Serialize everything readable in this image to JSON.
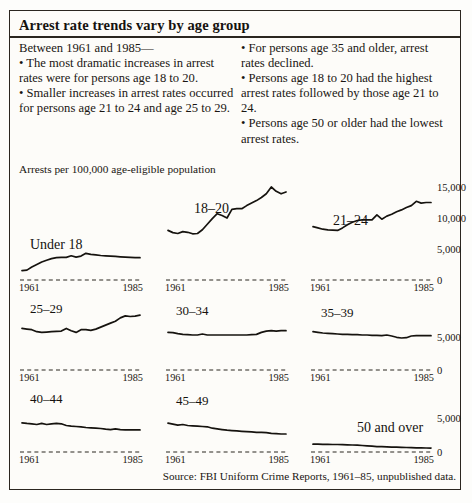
{
  "figure": {
    "title": "Arrest rate trends vary by age group",
    "left_column": [
      "Between 1961 and 1985—",
      "• The most dramatic increases in arrest rates were for persons age 18 to 20.",
      "• Smaller increases in arrest rates occurred for persons age 21 to 24 and age 25 to 29."
    ],
    "right_column": [
      "• For persons age 35 and older, arrest rates declined.",
      "• Persons age 18 to 20 had the highest arrest rates followed by those age 21 to 24.",
      "• Persons age 50 or older had the lowest arrest rates."
    ],
    "axis_caption": "Arrests per 100,000 age-eligible population",
    "source": "Source: FBI Uniform Crime Reports, 1961–85, unpublished data."
  },
  "chart_data": {
    "type": "line",
    "title": "Arrest rate trends vary by age group",
    "ylabel": "Arrests per 100,000 age-eligible population",
    "xlabel": "",
    "x": [
      1961,
      1962,
      1963,
      1964,
      1965,
      1966,
      1967,
      1968,
      1969,
      1970,
      1971,
      1972,
      1973,
      1974,
      1975,
      1976,
      1977,
      1978,
      1979,
      1980,
      1981,
      1982,
      1983,
      1984,
      1985
    ],
    "x_tick_labels": [
      "1961",
      "1985"
    ],
    "grid": false,
    "legend": "panel-labels",
    "rows": [
      {
        "ylim": [
          0,
          15000
        ],
        "y_ticks": [
          0,
          5000,
          10000,
          15000
        ],
        "y_tick_labels": [
          "0",
          "5,000",
          "10,000",
          "15,000"
        ],
        "panels": [
          {
            "name": "Under 18",
            "values": [
              1500,
              1600,
              2100,
              2500,
              2900,
              3200,
              3450,
              3600,
              3650,
              3650,
              3900,
              3700,
              3850,
              4300,
              4150,
              4050,
              3950,
              3900,
              3850,
              3800,
              3750,
              3700,
              3650,
              3600,
              3600
            ]
          },
          {
            "name": "18–20",
            "values": [
              8000,
              7650,
              7500,
              7800,
              7700,
              7450,
              7500,
              8100,
              9000,
              9900,
              10700,
              10400,
              10000,
              11400,
              11500,
              11500,
              12000,
              12400,
              12800,
              13300,
              13900,
              15000,
              14300,
              13900,
              14200
            ]
          },
          {
            "name": "21–24",
            "values": [
              8600,
              8400,
              8200,
              8100,
              8050,
              8000,
              8400,
              8900,
              9300,
              9600,
              9700,
              9700,
              9700,
              10500,
              9800,
              10300,
              10600,
              11000,
              11300,
              11700,
              12000,
              12700,
              12400,
              12500,
              12500
            ]
          }
        ]
      },
      {
        "ylim": [
          0,
          7500
        ],
        "y_ticks": [
          0,
          5000
        ],
        "y_tick_labels": [
          "0",
          "5,000"
        ],
        "panels": [
          {
            "name": "25–29",
            "values": [
              6300,
              6200,
              6100,
              5800,
              5700,
              5750,
              5800,
              5850,
              5900,
              6300,
              5950,
              5700,
              6100,
              6100,
              6000,
              6200,
              6500,
              6800,
              7100,
              7400,
              7900,
              8200,
              8100,
              8150,
              8300
            ]
          },
          {
            "name": "30–34",
            "values": [
              5700,
              5650,
              5500,
              5400,
              5350,
              5300,
              5300,
              5450,
              5300,
              5300,
              5300,
              5300,
              5300,
              5300,
              5300,
              5300,
              5300,
              5350,
              5400,
              5700,
              5900,
              5950,
              5900,
              5950,
              5950
            ]
          },
          {
            "name": "35–39",
            "values": [
              5800,
              5700,
              5600,
              5550,
              5500,
              5450,
              5400,
              5400,
              5350,
              5350,
              5300,
              5300,
              5250,
              5250,
              5200,
              5300,
              5150,
              4950,
              4850,
              4900,
              5150,
              5200,
              5200,
              5200,
              5200
            ]
          }
        ]
      },
      {
        "ylim": [
          0,
          7500
        ],
        "y_ticks": [
          0,
          5000
        ],
        "y_tick_labels": [
          "0",
          "5,000"
        ],
        "panels": [
          {
            "name": "40–44",
            "values": [
              4300,
              4200,
              4150,
              4050,
              4200,
              4050,
              4150,
              4200,
              4150,
              3900,
              3800,
              3750,
              3700,
              3600,
              3550,
              3500,
              3450,
              3350,
              3300,
              3400,
              3300,
              3250,
              3250,
              3250,
              3250
            ]
          },
          {
            "name": "45–49",
            "values": [
              4250,
              4100,
              3950,
              4050,
              3900,
              3850,
              3800,
              3750,
              3700,
              3500,
              3400,
              3300,
              3200,
              3150,
              3100,
              3050,
              3000,
              2950,
              2900,
              2900,
              2850,
              2750,
              2700,
              2650,
              2650
            ]
          },
          {
            "name": "50 and over",
            "values": [
              1150,
              1140,
              1130,
              1120,
              1110,
              1100,
              1080,
              1060,
              1030,
              1000,
              950,
              900,
              850,
              800,
              780,
              750,
              720,
              700,
              680,
              660,
              640,
              620,
              600,
              590,
              580
            ]
          }
        ]
      }
    ]
  }
}
